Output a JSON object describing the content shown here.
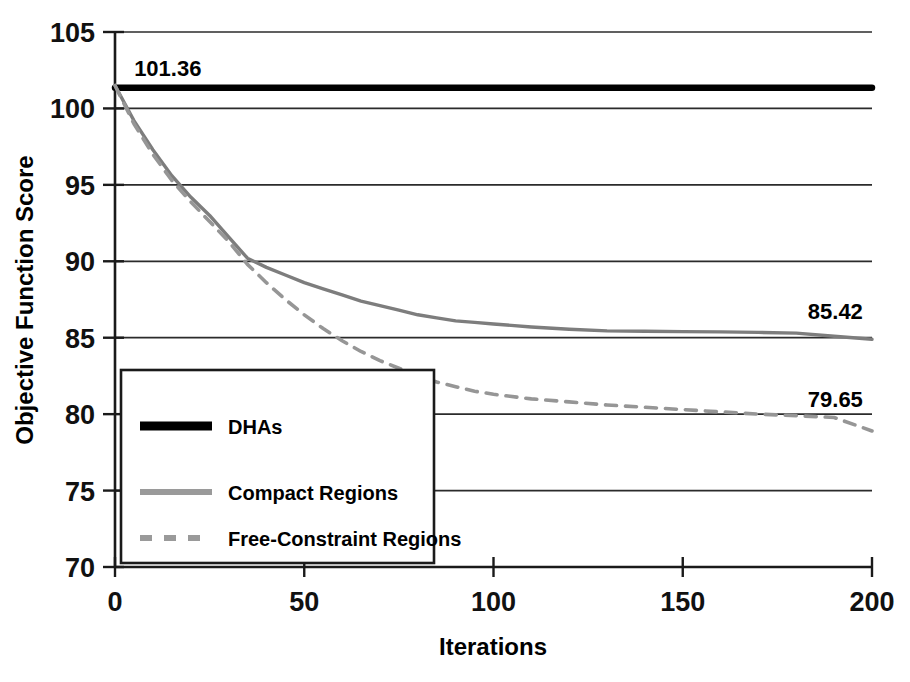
{
  "chart_data": {
    "type": "line",
    "title": "",
    "xlabel": "Iterations",
    "ylabel": "Objective Function Score",
    "xlim": [
      0,
      200
    ],
    "ylim": [
      70,
      105
    ],
    "xticks": [
      "0",
      "50",
      "100",
      "150",
      "200"
    ],
    "xtick_values": [
      0,
      50,
      100,
      150,
      200
    ],
    "yticks": [
      "70",
      "75",
      "80",
      "85",
      "90",
      "95",
      "100",
      "105"
    ],
    "ytick_values": [
      70,
      75,
      80,
      85,
      90,
      95,
      100,
      105
    ],
    "grid": "horizontal",
    "legend_position": "lower-left-inside",
    "annotations": [
      {
        "text": "101.36",
        "x": 4,
        "y": 101.36,
        "series": "DHAs"
      },
      {
        "text": "85.42",
        "x": 196,
        "y": 85.42,
        "series": "Compact Regions"
      },
      {
        "text": "79.65",
        "x": 196,
        "y": 79.65,
        "series": "Free-Constraint Regions"
      }
    ],
    "series": [
      {
        "name": "DHAs",
        "style": "solid-thick",
        "color": "#000000",
        "x": [
          0,
          200
        ],
        "values": [
          101.36,
          101.36
        ]
      },
      {
        "name": "Compact Regions",
        "style": "solid",
        "color": "#7d7d7d",
        "x": [
          0,
          5,
          10,
          15,
          20,
          25,
          30,
          35,
          40,
          45,
          50,
          55,
          60,
          65,
          70,
          75,
          80,
          85,
          90,
          95,
          100,
          110,
          120,
          130,
          140,
          150,
          160,
          170,
          180,
          190,
          200
        ],
        "values": [
          101.5,
          99.2,
          97.3,
          95.6,
          94.2,
          93.0,
          91.6,
          90.2,
          89.6,
          89.1,
          88.6,
          88.2,
          87.8,
          87.4,
          87.1,
          86.8,
          86.5,
          86.3,
          86.1,
          86.0,
          85.9,
          85.7,
          85.55,
          85.45,
          85.42,
          85.4,
          85.38,
          85.35,
          85.3,
          85.1,
          84.9
        ]
      },
      {
        "name": "Free-Constraint Regions",
        "style": "dashed",
        "color": "#969696",
        "x": [
          0,
          5,
          10,
          15,
          20,
          25,
          30,
          35,
          40,
          45,
          50,
          55,
          60,
          65,
          70,
          75,
          80,
          85,
          90,
          95,
          100,
          110,
          120,
          130,
          140,
          150,
          160,
          170,
          175,
          180,
          190,
          200
        ],
        "values": [
          101.5,
          99.0,
          97.0,
          95.3,
          93.9,
          92.6,
          91.3,
          89.8,
          88.6,
          87.5,
          86.5,
          85.6,
          84.8,
          84.1,
          83.5,
          83.0,
          82.5,
          82.1,
          81.8,
          81.5,
          81.3,
          81.0,
          80.8,
          80.6,
          80.45,
          80.3,
          80.15,
          80.0,
          79.95,
          79.9,
          79.78,
          78.9
        ]
      }
    ]
  },
  "legend": {
    "items": [
      {
        "label": "DHAs",
        "style": "solid-thick",
        "color": "#000000"
      },
      {
        "label": "Compact Regions",
        "style": "solid",
        "color": "#9a9a9a"
      },
      {
        "label": "Free-Constraint Regions",
        "style": "dashed",
        "color": "#9a9a9a"
      }
    ]
  }
}
